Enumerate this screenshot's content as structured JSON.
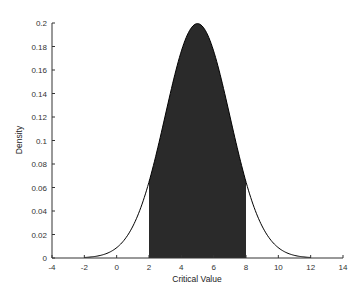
{
  "chart_data": {
    "type": "area",
    "title": "",
    "xlabel": "Critical Value",
    "ylabel": "Density",
    "xlim": [
      -4,
      14
    ],
    "ylim": [
      0,
      0.2
    ],
    "xticks": [
      -4,
      -2,
      0,
      2,
      4,
      6,
      8,
      10,
      12,
      14
    ],
    "yticks": [
      0,
      0.02,
      0.04,
      0.06,
      0.08,
      0.1,
      0.12,
      0.14,
      0.16,
      0.18,
      0.2
    ],
    "xtick_labels": [
      "-4",
      "-2",
      "0",
      "2",
      "4",
      "6",
      "8",
      "10",
      "12",
      "14"
    ],
    "ytick_labels": [
      "0",
      "0.02",
      "0.04",
      "0.06",
      "0.08",
      "0.1",
      "0.12",
      "0.14",
      "0.16",
      "0.18",
      "0.2"
    ],
    "grid": false,
    "series": [
      {
        "name": "Normal density (mean 5, sd 2)",
        "distribution": "normal",
        "mean": 5,
        "sd": 2,
        "x_range": [
          -2,
          12
        ],
        "x": [
          -2,
          -1,
          0,
          1,
          2,
          3,
          4,
          5,
          6,
          7,
          8,
          9,
          10,
          11,
          12
        ],
        "values": [
          0.0004,
          0.0022,
          0.0088,
          0.027,
          0.0648,
          0.121,
          0.176,
          0.1995,
          0.176,
          0.121,
          0.0648,
          0.027,
          0.0088,
          0.0022,
          0.0004
        ],
        "color": "#000000"
      }
    ],
    "shaded_region": {
      "from": 2,
      "to": 8,
      "color": "#2a2a2a"
    }
  }
}
